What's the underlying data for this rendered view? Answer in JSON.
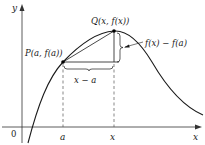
{
  "diagram": {
    "axes": {
      "x_label": "x",
      "y_label": "y",
      "origin_label": "0"
    },
    "ticks": {
      "a_label": "a",
      "x_label": "x"
    },
    "points": {
      "P_label": "P(a, f(a))",
      "Q_label": "Q(x, f(x))"
    },
    "annotations": {
      "horizontal_difference": "x − a",
      "vertical_difference": "f(x) − f(a)"
    },
    "colors": {
      "curve": "#1a1a1a",
      "axes": "#333333",
      "dashed": "#555555",
      "background": "#ffffff"
    }
  }
}
